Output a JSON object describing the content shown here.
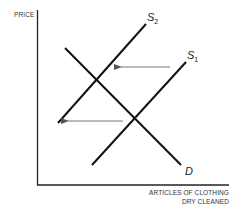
{
  "diagram": {
    "type": "supply-demand",
    "y_axis": {
      "label": "PRICE"
    },
    "x_axis": {
      "label_line1": "ARTICLES OF CLOTHING",
      "label_line2": "DRY CLEANED"
    },
    "curves": [
      {
        "id": "S2",
        "letter": "S",
        "subscript": "2",
        "kind": "supply"
      },
      {
        "id": "S1",
        "letter": "S",
        "subscript": "1",
        "kind": "supply"
      },
      {
        "id": "D",
        "letter": "D",
        "subscript": "",
        "kind": "demand"
      }
    ],
    "arrows": [
      {
        "name": "upper-shift-arrow",
        "direction": "left",
        "meaning": "supply shifts from S1 to S2"
      },
      {
        "name": "lower-shift-arrow",
        "direction": "left",
        "meaning": "supply shifts from S1 to S2"
      }
    ],
    "colors": {
      "line": "#111111",
      "arrow": "#777777",
      "text": "#333333"
    }
  }
}
